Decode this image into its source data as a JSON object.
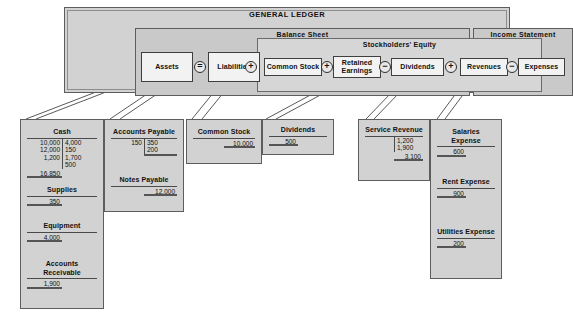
{
  "ledger": {
    "title": "GENERAL LEDGER",
    "statements": [
      {
        "name": "balance-sheet",
        "label": "Balance Sheet"
      },
      {
        "name": "income-statement",
        "label": "Income Statement"
      }
    ],
    "equity_group_label": "Stockholders' Equity",
    "accounts": [
      {
        "label": "Assets"
      },
      {
        "label": "Liabilities"
      },
      {
        "label": "Common Stock"
      },
      {
        "label": "Retained Earnings"
      },
      {
        "label": "Dividends"
      },
      {
        "label": "Revenues"
      },
      {
        "label": "Expenses"
      }
    ],
    "operators": [
      {
        "symbol": "=",
        "name": "equals"
      },
      {
        "symbol": "+",
        "name": "plus"
      },
      {
        "symbol": "+",
        "name": "plus"
      },
      {
        "symbol": "−",
        "name": "minus"
      },
      {
        "symbol": "+",
        "name": "plus"
      },
      {
        "symbol": "−",
        "name": "minus"
      }
    ]
  },
  "columns": [
    {
      "name": "cash-column",
      "accounts": [
        {
          "name": "cash",
          "title": "Cash",
          "debits": [
            "10,000",
            "12,000",
            "1,200"
          ],
          "credits": [
            "4,000",
            "150",
            "1,700",
            "500"
          ],
          "balance": "16,850",
          "balance_side": "debit"
        },
        {
          "name": "supplies",
          "title": "Supplies",
          "debits": [],
          "credits": [],
          "balance": "350",
          "balance_side": "debit"
        },
        {
          "name": "equipment",
          "title": "Equipment",
          "debits": [],
          "credits": [],
          "balance": "4,000",
          "balance_side": "debit"
        },
        {
          "name": "accounts-receivable",
          "title": "Accounts Receivable",
          "debits": [],
          "credits": [],
          "balance": "1,900",
          "balance_side": "debit"
        }
      ]
    },
    {
      "name": "payables-column",
      "accounts": [
        {
          "name": "accounts-payable",
          "title": "Accounts Payable",
          "debits": [
            "150"
          ],
          "credits": [
            "350",
            "200"
          ],
          "balance": "",
          "balance_side": "credit"
        },
        {
          "name": "notes-payable",
          "title": "Notes Payable",
          "debits": [],
          "credits": [],
          "balance": "12,000",
          "balance_side": "credit"
        }
      ]
    },
    {
      "name": "common-stock-column",
      "accounts": [
        {
          "name": "common-stock",
          "title": "Common Stock",
          "debits": [],
          "credits": [],
          "balance": "10,000",
          "balance_side": "credit"
        }
      ]
    },
    {
      "name": "dividends-column",
      "accounts": [
        {
          "name": "dividends",
          "title": "Dividends",
          "debits": [],
          "credits": [],
          "balance": "500",
          "balance_side": "debit"
        }
      ]
    },
    {
      "name": "service-revenue-column",
      "accounts": [
        {
          "name": "service-revenue",
          "title": "Service Revenue",
          "debits": [],
          "credits": [
            "1,200",
            "1,900"
          ],
          "balance": "3,100",
          "balance_side": "credit"
        }
      ]
    },
    {
      "name": "expenses-column",
      "accounts": [
        {
          "name": "salaries-expense",
          "title": "Salaries Expense",
          "debits": [],
          "credits": [],
          "balance": "600",
          "balance_side": "debit"
        },
        {
          "name": "rent-expense",
          "title": "Rent Expense",
          "debits": [],
          "credits": [],
          "balance": "900",
          "balance_side": "debit"
        },
        {
          "name": "utilities-expense",
          "title": "Utilities Expense",
          "debits": [],
          "credits": [],
          "balance": "200",
          "balance_side": "debit"
        }
      ]
    }
  ],
  "colors": {
    "page": "#ffffff",
    "panel": "#c9c9c9",
    "card": "#d2d2d2",
    "chip": "#f2f2f2",
    "outline": "#5d5d5d",
    "text": "#111111"
  }
}
